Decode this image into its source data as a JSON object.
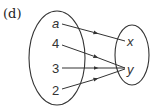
{
  "figure": {
    "part_label": "(d)",
    "domain_set": {
      "elements": [
        {
          "label": "a",
          "italic": true
        },
        {
          "label": "4",
          "italic": false
        },
        {
          "label": "3",
          "italic": false
        },
        {
          "label": "2",
          "italic": false
        }
      ]
    },
    "codomain_set": {
      "elements": [
        {
          "label": "x",
          "italic": true
        },
        {
          "label": "y",
          "italic": true
        }
      ]
    },
    "mappings": [
      {
        "from": "a",
        "to": "x"
      },
      {
        "from": "4",
        "to": "y"
      },
      {
        "from": "3",
        "to": "y"
      },
      {
        "from": "2",
        "to": "y"
      }
    ],
    "colors": {
      "stroke": "#333333",
      "background": "#ffffff"
    }
  }
}
